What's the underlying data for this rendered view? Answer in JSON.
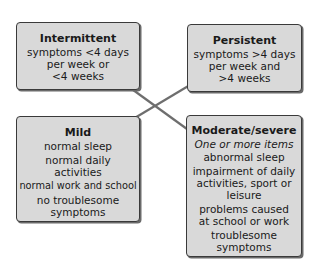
{
  "diagram": {
    "type": "classification-matrix",
    "boxes": {
      "intermittent": {
        "title": "Intermittent",
        "lines": [
          "symptoms <4 days",
          "per week or",
          "<4 weeks"
        ]
      },
      "persistent": {
        "title": "Persistent",
        "lines": [
          "symptoms >4 days",
          "per week and",
          ">4 weeks"
        ]
      },
      "mild": {
        "title": "Mild",
        "items": [
          "normal sleep",
          "normal daily activities",
          "normal work and school",
          "no troublesome symptoms"
        ]
      },
      "moderate": {
        "title": "Moderate/severe",
        "subtitle": "One or more items",
        "items": [
          "abnormal sleep",
          "impairment of daily activities, sport or leisure",
          "problems caused at school or work",
          "troublesome symptoms"
        ]
      }
    },
    "arrows": [
      {
        "from": "intermittent",
        "to": "moderate",
        "bidirectional": true
      },
      {
        "from": "persistent",
        "to": "mild",
        "bidirectional": true
      }
    ],
    "colors": {
      "box_fill": "#d9d9d9",
      "box_border": "#3a3a3a",
      "arrow": "#6e6e6e"
    }
  }
}
